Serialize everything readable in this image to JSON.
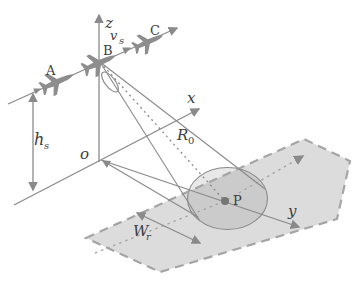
{
  "colors": {
    "background": "#ffffff",
    "line": "#8a8a8a",
    "text": "#3e3e3e",
    "aircraft": "#8d8d8d",
    "swath_fill": "#dcdcdc",
    "swath_border": "#a5a5a5",
    "ellipse_fill": "rgba(125,125,125,0.18)",
    "target_dot": "#767676"
  },
  "icons": {
    "aircraft": "airplane-silhouette",
    "arrow": "arrowhead-triangle"
  },
  "diagram": {
    "axis_labels": {
      "z": "z",
      "x": "x",
      "y": "y",
      "origin": "o"
    },
    "flight_path": {
      "aircraft_labels": {
        "a": "A",
        "b": "B",
        "c": "C"
      },
      "velocity_label": {
        "base": "v",
        "sub": "s"
      }
    },
    "measurements": {
      "platform_height": {
        "base": "h",
        "sub": "s"
      },
      "slant_range": {
        "base": "R",
        "sub": "0"
      },
      "swath_width": {
        "base": "W",
        "sub": "r"
      }
    },
    "ground": {
      "target_label": "P"
    }
  }
}
